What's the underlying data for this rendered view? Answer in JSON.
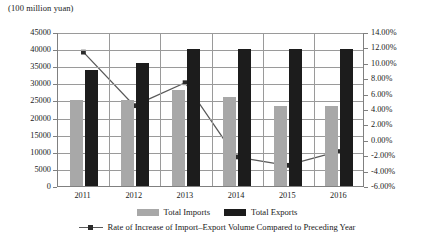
{
  "chart_data": {
    "type": "bar",
    "title": "(100 million yuan)",
    "xlabel": "",
    "ylabel": "",
    "categories": [
      "2011",
      "2012",
      "2013",
      "2014",
      "2015",
      "2016"
    ],
    "grid": true,
    "legend_position": "bottom",
    "series": [
      {
        "name": "Total Imports",
        "type": "bar",
        "axis": "left",
        "color": "#a8a8a8",
        "values": [
          25000,
          25200,
          28000,
          26000,
          23500,
          23500
        ]
      },
      {
        "name": "Total Exports",
        "type": "bar",
        "axis": "left",
        "color": "#1c1c1c",
        "values": [
          34000,
          36000,
          40000,
          40000,
          40000,
          40000
        ]
      },
      {
        "name": "Rate of Increase of Import–Export Volume Compared to Preceding Year",
        "type": "line",
        "axis": "right",
        "color": "#595959",
        "values": [
          11.5,
          4.5,
          7.5,
          -2.2,
          -3.3,
          -1.5
        ]
      }
    ],
    "left_axis": {
      "ylim": [
        0,
        45000
      ],
      "step": 5000,
      "ticks": [
        "45000",
        "40000",
        "35000",
        "30000",
        "25000",
        "20000",
        "15000",
        "10000",
        "5000",
        "0"
      ],
      "tick_values": [
        45000,
        40000,
        35000,
        30000,
        25000,
        20000,
        15000,
        10000,
        5000,
        0
      ]
    },
    "right_axis": {
      "ylim": [
        -6,
        14
      ],
      "step": 2,
      "ticks": [
        "14.00%",
        "12.00%",
        "10.00%",
        "8.00%",
        "6.00%",
        "4.00%",
        "2.00%",
        "0.00%",
        "-2.00%",
        "-4.00%",
        "-6.00%"
      ],
      "tick_values": [
        14,
        12,
        10,
        8,
        6,
        4,
        2,
        0,
        -2,
        -4,
        -6
      ]
    }
  },
  "legend": {
    "imports_label": "Total Imports",
    "exports_label": "Total Exports",
    "rate_label": "Rate of Increase of Import–Export Volume Compared to Preceding Year"
  },
  "colors": {
    "imports": "#a8a8a8",
    "exports": "#1c1c1c",
    "line": "#595959",
    "grid": "#9a9a9a",
    "axis": "#808080"
  }
}
